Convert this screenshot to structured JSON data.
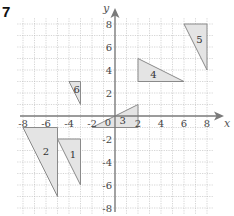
{
  "question_number": "7",
  "axes": {
    "x_label": "x",
    "y_label": "y",
    "origin_label": "0",
    "x_ticks": [
      "-8",
      "-6",
      "-4",
      "-2",
      "2",
      "4",
      "6",
      "8"
    ],
    "x_tick_values": [
      -8,
      -6,
      -4,
      -2,
      2,
      4,
      6,
      8
    ],
    "y_ticks": [
      "8",
      "6",
      "4",
      "2",
      "-2",
      "-4",
      "-6",
      "-8"
    ],
    "y_tick_values": [
      8,
      6,
      4,
      2,
      -2,
      -4,
      -6,
      -8
    ],
    "range": {
      "xmin": -8,
      "xmax": 8,
      "ymin": -8,
      "ymax": 8
    },
    "grid": "dotted, 1 unit spacing"
  },
  "colors": {
    "triangle_fill": "#e4e4e4",
    "triangle_stroke": "#8a8a8a",
    "axis": "#7a7a7a",
    "grid": "#b9b9b9"
  },
  "shapes": [
    {
      "label": "1",
      "vertices": [
        [
          -5,
          -2
        ],
        [
          -3,
          -2
        ],
        [
          -3,
          -6
        ]
      ]
    },
    {
      "label": "2",
      "vertices": [
        [
          -8,
          -1
        ],
        [
          -5,
          -1
        ],
        [
          -5,
          -7
        ]
      ]
    },
    {
      "label": "3",
      "vertices": [
        [
          -2,
          -1
        ],
        [
          2,
          1
        ],
        [
          2,
          -1
        ]
      ]
    },
    {
      "label": "4",
      "vertices": [
        [
          2,
          5
        ],
        [
          2,
          3
        ],
        [
          6,
          3
        ]
      ]
    },
    {
      "label": "5",
      "vertices": [
        [
          6,
          8
        ],
        [
          8,
          8
        ],
        [
          8,
          4
        ]
      ]
    },
    {
      "label": "6",
      "vertices": [
        [
          -4,
          3
        ],
        [
          -3,
          3
        ],
        [
          -3,
          1
        ]
      ]
    }
  ]
}
